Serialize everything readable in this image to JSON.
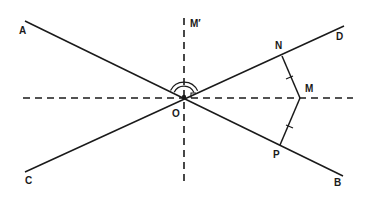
{
  "diagram": {
    "type": "geometry",
    "colors": {
      "stroke": "#1a1a1a",
      "background": "#ffffff"
    },
    "points": {
      "O": {
        "label": "O",
        "x": 184,
        "y": 97,
        "label_x": 172,
        "label_y": 117
      },
      "A": {
        "label": "A",
        "x": 25,
        "y": 21,
        "label_x": 19,
        "label_y": 34
      },
      "B": {
        "label": "B",
        "x": 343,
        "y": 176,
        "label_x": 334,
        "label_y": 186
      },
      "C": {
        "label": "C",
        "x": 25,
        "y": 172,
        "label_x": 25,
        "label_y": 184
      },
      "D": {
        "label": "D",
        "x": 344,
        "y": 26,
        "label_x": 336,
        "label_y": 40
      },
      "N": {
        "label": "N",
        "x": 282,
        "y": 56,
        "label_x": 275,
        "label_y": 49
      },
      "M": {
        "label": "M",
        "x": 300,
        "y": 98,
        "label_x": 305,
        "label_y": 92
      },
      "P": {
        "label": "P",
        "x": 280,
        "y": 145,
        "label_x": 273,
        "label_y": 158
      },
      "M_prime": {
        "label": "M′",
        "x": 184,
        "y": 18,
        "label_x": 190,
        "label_y": 27
      }
    },
    "lines": [
      {
        "name": "line-AB",
        "from": "A",
        "to": "B",
        "style": "solid"
      },
      {
        "name": "line-CD",
        "from": "C",
        "to": "D",
        "style": "solid"
      },
      {
        "name": "segment-MN",
        "from": "M",
        "to": "N",
        "style": "solid",
        "tick_marks": 1
      },
      {
        "name": "segment-MP",
        "from": "M",
        "to": "P",
        "style": "solid",
        "tick_marks": 1
      },
      {
        "name": "horizontal-bisector",
        "from_x": 23,
        "to_x": 353,
        "y": 98,
        "style": "dashed"
      },
      {
        "name": "vertical-bisector-OM-prime",
        "x": 184,
        "from_y": 18,
        "to_y": 186,
        "style": "dashed"
      }
    ],
    "angle_marks": [
      {
        "name": "double-arc-angle-AOD",
        "type": "double-arc"
      },
      {
        "name": "right-angle-M-prime-O-M",
        "type": "square"
      }
    ]
  }
}
